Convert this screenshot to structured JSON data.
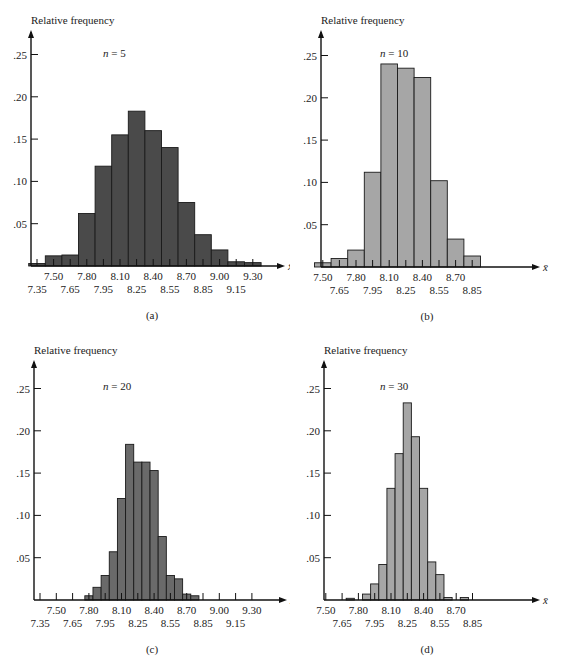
{
  "figure": {
    "panels": [
      {
        "id": "a",
        "caption": "(a)",
        "ylabel": "Relative frequency",
        "n_label": "n = 5",
        "xlabel": "x̄",
        "bar_color": "#4a4a4a"
      },
      {
        "id": "b",
        "caption": "(b)",
        "ylabel": "Relative frequency",
        "n_label": "n = 10",
        "xlabel": "x̄",
        "bar_color": "#a6a6a6"
      },
      {
        "id": "c",
        "caption": "(c)",
        "ylabel": "Relative frequency",
        "n_label": "n = 20",
        "xlabel": "x̄",
        "bar_color": "#6a6a6a"
      },
      {
        "id": "d",
        "caption": "(d)",
        "ylabel": "Relative frequency",
        "n_label": "n = 30",
        "xlabel": "x̄",
        "bar_color": "#a6a6a6"
      }
    ]
  },
  "chart_data": [
    {
      "type": "bar",
      "title": "n = 5",
      "caption": "(a)",
      "xlabel": "x̄",
      "ylabel": "Relative frequency",
      "ylim": [
        0,
        0.27
      ],
      "yticks": [
        ".05",
        ".10",
        ".15",
        ".20",
        ".25"
      ],
      "xticks_upper": [
        "7.50",
        "7.80",
        "8.10",
        "8.40",
        "8.70",
        "9.00",
        "9.30"
      ],
      "xticks_lower": [
        "7.35",
        "7.65",
        "7.95",
        "8.25",
        "8.55",
        "8.85",
        "9.15"
      ],
      "bin_width": 0.15,
      "categories": [
        "7.35",
        "7.50",
        "7.65",
        "7.80",
        "7.95",
        "8.10",
        "8.25",
        "8.40",
        "8.55",
        "8.70",
        "8.85",
        "9.00",
        "9.15",
        "9.30"
      ],
      "values": [
        0.003,
        0.012,
        0.013,
        0.062,
        0.118,
        0.155,
        0.183,
        0.16,
        0.14,
        0.075,
        0.037,
        0.019,
        0.005,
        0.004
      ],
      "grid": false,
      "color": "#4a4a4a"
    },
    {
      "type": "bar",
      "title": "n = 10",
      "caption": "(b)",
      "xlabel": "x̄",
      "ylabel": "Relative frequency",
      "ylim": [
        0,
        0.27
      ],
      "yticks": [
        ".05",
        ".10",
        ".15",
        ".20",
        ".25"
      ],
      "xticks_upper": [
        "7.50",
        "7.80",
        "8.10",
        "8.40",
        "8.70"
      ],
      "xticks_lower": [
        "7.65",
        "7.95",
        "8.25",
        "8.55",
        "8.85"
      ],
      "bin_width": 0.15,
      "categories": [
        "7.50",
        "7.65",
        "7.80",
        "7.95",
        "8.10",
        "8.25",
        "8.40",
        "8.55",
        "8.70",
        "8.85"
      ],
      "values": [
        0.005,
        0.01,
        0.02,
        0.112,
        0.24,
        0.235,
        0.224,
        0.102,
        0.033,
        0.013
      ],
      "grid": false,
      "color": "#a6a6a6"
    },
    {
      "type": "bar",
      "title": "n = 20",
      "caption": "(c)",
      "xlabel": "x̄",
      "ylabel": "Relative frequency",
      "ylim": [
        0,
        0.27
      ],
      "yticks": [
        ".05",
        ".10",
        ".15",
        ".20",
        ".25"
      ],
      "xticks_upper": [
        "7.50",
        "7.80",
        "8.10",
        "8.40",
        "8.70",
        "9.00",
        "9.30"
      ],
      "xticks_lower": [
        "7.35",
        "7.65",
        "7.95",
        "8.25",
        "8.55",
        "8.85",
        "9.15"
      ],
      "bin_width": 0.075,
      "categories": [
        "7.800",
        "7.875",
        "7.950",
        "8.025",
        "8.100",
        "8.175",
        "8.250",
        "8.325",
        "8.400",
        "8.475",
        "8.550",
        "8.625",
        "8.700",
        "8.775"
      ],
      "values": [
        0.005,
        0.015,
        0.029,
        0.057,
        0.12,
        0.184,
        0.163,
        0.163,
        0.153,
        0.075,
        0.029,
        0.025,
        0.007,
        0.005
      ],
      "grid": false,
      "color": "#6a6a6a"
    },
    {
      "type": "bar",
      "title": "n = 30",
      "caption": "(d)",
      "xlabel": "x̄",
      "ylabel": "Relative frequency",
      "ylim": [
        0,
        0.27
      ],
      "yticks": [
        ".05",
        ".10",
        ".15",
        ".20",
        ".25"
      ],
      "xticks_upper": [
        "7.50",
        "7.80",
        "8.10",
        "8.40",
        "8.70"
      ],
      "xticks_lower": [
        "7.65",
        "7.95",
        "8.25",
        "8.55",
        "8.85"
      ],
      "bin_width": 0.075,
      "categories": [
        "7.725",
        "7.800",
        "7.875",
        "7.950",
        "8.025",
        "8.100",
        "8.175",
        "8.250",
        "8.325",
        "8.400",
        "8.475",
        "8.550",
        "8.625",
        "8.700",
        "8.775"
      ],
      "values": [
        0.002,
        0.0,
        0.007,
        0.019,
        0.042,
        0.132,
        0.173,
        0.233,
        0.193,
        0.132,
        0.045,
        0.03,
        0.003,
        0.0,
        0.003
      ],
      "grid": false,
      "color": "#a6a6a6"
    }
  ]
}
